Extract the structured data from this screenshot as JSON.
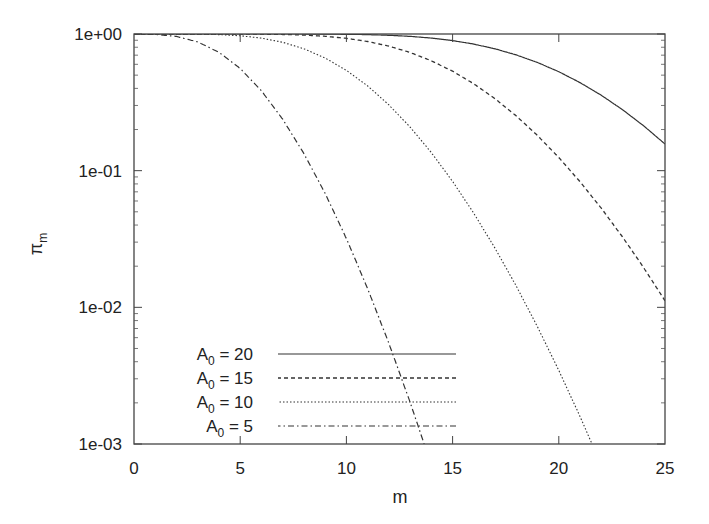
{
  "chart_data": {
    "type": "line",
    "title": "",
    "xlabel": "m",
    "ylabel": "π",
    "ylabel_subscript": "m",
    "xlim": [
      0,
      25
    ],
    "ylim": [
      0.001,
      1
    ],
    "yscale": "log",
    "grid": false,
    "legend_position": "lower left (inside)",
    "x_ticks": [
      "0",
      "5",
      "10",
      "15",
      "20",
      "25"
    ],
    "y_ticks": [
      "1e+00",
      "1e-01",
      "1e-02",
      "1e-03"
    ],
    "series": [
      {
        "name": "A0 = 20",
        "label_main": "A",
        "label_sub": "0",
        "label_rest": " = 20",
        "A0": 20,
        "style": "solid",
        "x": [
          0,
          5,
          10,
          15,
          17,
          19,
          21,
          23,
          25
        ],
        "values": [
          1.0,
          1.0,
          1.0,
          0.95,
          0.87,
          0.73,
          0.56,
          0.33,
          0.11
        ]
      },
      {
        "name": "A0 = 15",
        "label_main": "A",
        "label_sub": "0",
        "label_rest": " = 15",
        "A0": 15,
        "style": "dashed",
        "x": [
          0,
          5,
          10,
          12,
          14,
          16,
          18,
          20,
          22,
          25
        ],
        "values": [
          1.0,
          1.0,
          0.96,
          0.88,
          0.72,
          0.53,
          0.3,
          0.12,
          0.04,
          0.006
        ]
      },
      {
        "name": "A0 = 10",
        "label_main": "A",
        "label_sub": "0",
        "label_rest": " = 10",
        "A0": 10,
        "style": "dotted",
        "x": [
          0,
          4,
          6,
          8,
          10,
          12,
          14,
          16,
          18,
          20,
          20.5
        ],
        "values": [
          1.0,
          0.99,
          0.93,
          0.78,
          0.54,
          0.3,
          0.12,
          0.035,
          0.007,
          0.0016,
          0.001
        ]
      },
      {
        "name": "A0 = 5",
        "label_main": "A",
        "label_sub": "0",
        "label_rest": " = 5",
        "A0": 5,
        "style": "dash-dot",
        "x": [
          0,
          1,
          2,
          4,
          6,
          8,
          10,
          12,
          12.6
        ],
        "values": [
          1.0,
          0.99,
          0.96,
          0.73,
          0.38,
          0.13,
          0.032,
          0.0055,
          0.001
        ]
      }
    ]
  },
  "colors": {
    "axis": "#444444",
    "line": "#333333",
    "background": "#ffffff"
  }
}
